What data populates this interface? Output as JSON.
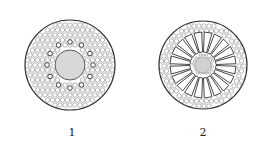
{
  "figures": [
    {
      "label": "1",
      "description": "Cross-section of root with central pith and scattered vascular bundles",
      "cx": 70,
      "cy": 65,
      "r": 45,
      "core_r": 15,
      "core_color": "#d8d8d8"
    },
    {
      "label": "2",
      "description": "Cross-section with radial air chambers (aerenchyma) around central stele",
      "cx": 203,
      "cy": 65,
      "r": 44,
      "spokes": 20,
      "core_r": 8,
      "core_color": "#d0d0d0"
    }
  ],
  "colors": {
    "line": "#333333",
    "cell": "#777777",
    "background": "#ffffff"
  }
}
